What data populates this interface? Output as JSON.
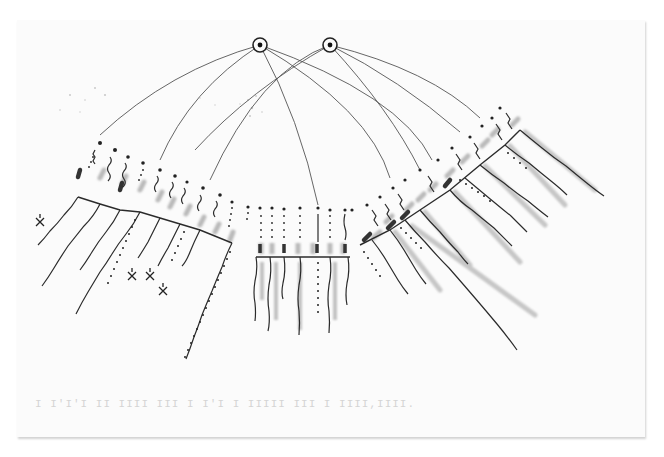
{
  "figure": {
    "caption_bleedthrough": "I I'I'I II IIII III I I'I I IIIII III I IIII,IIII.",
    "colors": {
      "paper": "#fbfbfb",
      "ink": "#2b2b2b",
      "marker_gray": "#a8a8a8",
      "thin_line": "#555555"
    }
  },
  "nodes": [
    {
      "id": "A",
      "x": 260,
      "y": 45,
      "r": 7
    },
    {
      "id": "B",
      "x": 330,
      "y": 45,
      "r": 7
    }
  ],
  "connections": [
    {
      "from": "A",
      "d": "M260,45 Q170,70 100,135"
    },
    {
      "from": "A",
      "d": "M260,45 Q190,90 160,160"
    },
    {
      "from": "A",
      "d": "M260,45 Q300,120 318,205"
    },
    {
      "from": "A",
      "d": "M260,45 Q370,110 390,178"
    },
    {
      "from": "A",
      "d": "M260,45 Q400,95 432,160"
    },
    {
      "from": "B",
      "d": "M330,45 Q260,70 210,180"
    },
    {
      "from": "B",
      "d": "M330,45 Q250,90 195,150"
    },
    {
      "from": "B",
      "d": "M330,45 Q400,80 460,132"
    },
    {
      "from": "B",
      "d": "M330,45 Q430,70 480,118"
    },
    {
      "from": "B",
      "d": "M330,45 Q390,110 420,170"
    }
  ],
  "clusters": {
    "left_fan": {
      "baseline": "M78,197 L100,204 L120,210 L140,212 L160,218 L180,224 L200,230 L232,243",
      "strand_count": 12,
      "markers": [
        {
          "label": "x-mark",
          "x": 40,
          "y": 222
        },
        {
          "label": "x-mark",
          "x": 132,
          "y": 276
        },
        {
          "label": "x-mark",
          "x": 150,
          "y": 276
        },
        {
          "label": "x-mark",
          "x": 163,
          "y": 291
        }
      ]
    },
    "center_comb": {
      "baseline": "M256,257 L350,257",
      "strand_count": 9
    },
    "right_fan": {
      "baseline": "M360,245 L390,230 L420,210 L450,190 L480,165 L505,145 L520,130",
      "strand_count": 13
    }
  }
}
